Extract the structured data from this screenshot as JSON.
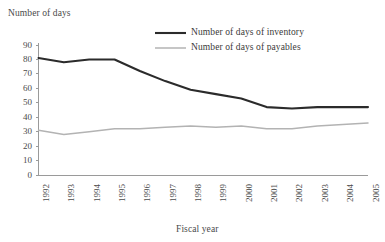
{
  "chart_data": {
    "type": "line",
    "title": "",
    "xlabel": "Fiscal year",
    "ylabel": "Number of days",
    "ylim": [
      0,
      90
    ],
    "ytick_step": 10,
    "yticks": [
      90,
      80,
      70,
      60,
      50,
      40,
      30,
      20,
      10,
      0
    ],
    "grid": false,
    "legend_position": "top-right",
    "categories": [
      "1992",
      "1993",
      "1994",
      "1995",
      "1996",
      "1997",
      "1998",
      "1999",
      "2000",
      "2001",
      "2002",
      "2003",
      "2004",
      "2005"
    ],
    "series": [
      {
        "name": "Number of days of inventory",
        "color": "#2b2b2b",
        "width": 2.1,
        "values": [
          81,
          78,
          80,
          80,
          72,
          65,
          59,
          56,
          53,
          47,
          46,
          47,
          47,
          47
        ]
      },
      {
        "name": "Number of days of payables",
        "color": "#b3b3b3",
        "width": 1.5,
        "values": [
          31,
          28,
          30,
          32,
          32,
          33,
          34,
          33,
          34,
          32,
          32,
          34,
          35,
          36
        ]
      }
    ]
  },
  "legend": {
    "entries": [
      {
        "label": "Number of days of inventory",
        "color": "#2b2b2b"
      },
      {
        "label": "Number of days of payables",
        "color": "#b3b3b3"
      }
    ]
  },
  "axes": {
    "y_title": "Number of days",
    "x_title": "Fiscal year",
    "axis_color": "#9a9a9a"
  }
}
